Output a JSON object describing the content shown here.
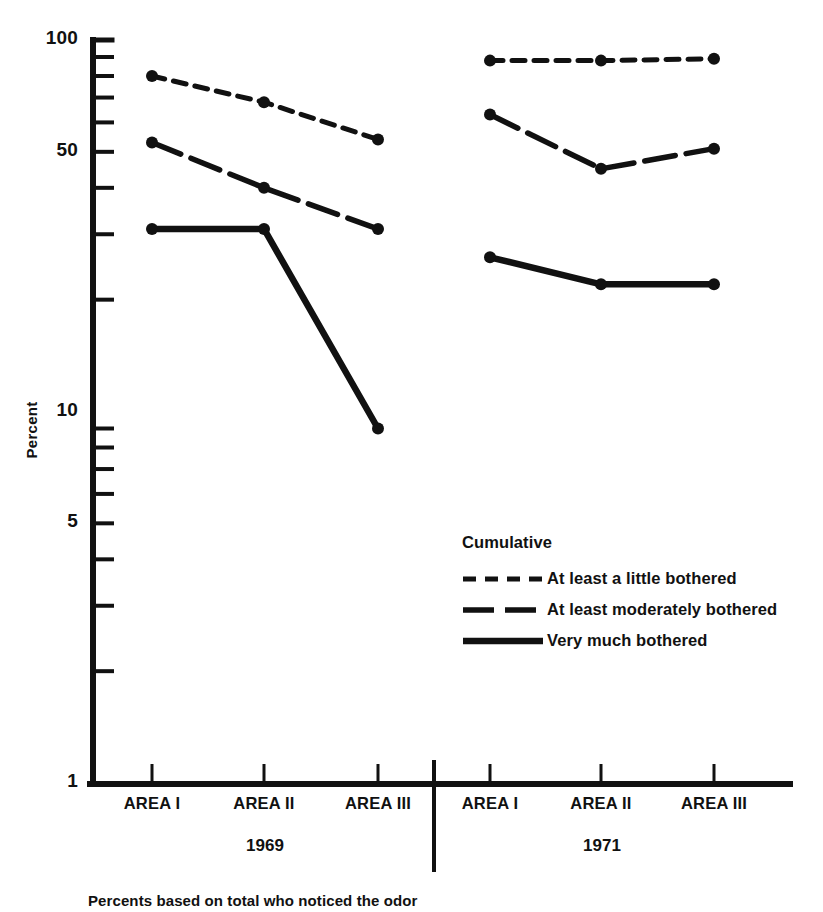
{
  "chart_data": {
    "type": "line",
    "title": "",
    "xlabel": "",
    "ylabel": "Percent",
    "yscale": "log",
    "ylim": [
      1,
      100
    ],
    "ytick_labels": [
      "100",
      "50",
      "10",
      "5",
      "1"
    ],
    "ytick_values": [
      100,
      50,
      10,
      5,
      1
    ],
    "grid": false,
    "legend_position": "inside-lower-right",
    "legend_title": "Cumulative",
    "categories": [
      "AREA I",
      "AREA II",
      "AREA III",
      "AREA I",
      "AREA II",
      "AREA III"
    ],
    "groups": [
      {
        "label": "1969",
        "categories": [
          "AREA I",
          "AREA II",
          "AREA III"
        ]
      },
      {
        "label": "1971",
        "categories": [
          "AREA I",
          "AREA II",
          "AREA III"
        ]
      }
    ],
    "series": [
      {
        "name": "At least a little bothered",
        "style": "short-dash",
        "values_1969": [
          80,
          68,
          54
        ],
        "values_1971": [
          88,
          88,
          89
        ],
        "values": [
          80,
          68,
          54,
          88,
          88,
          89
        ]
      },
      {
        "name": "At least moderately bothered",
        "style": "long-dash",
        "values_1969": [
          53,
          40,
          31
        ],
        "values_1971": [
          63,
          45,
          51
        ],
        "values": [
          53,
          40,
          31,
          63,
          45,
          51
        ]
      },
      {
        "name": "Very much bothered",
        "style": "solid",
        "values_1969": [
          31,
          31,
          9
        ],
        "values_1971": [
          26,
          22,
          22
        ],
        "values": [
          31,
          31,
          9,
          26,
          22,
          22
        ]
      }
    ],
    "annotations": [
      "Percents based on total who noticed the odor"
    ]
  },
  "axes": {
    "y_label": "Percent",
    "y_ticks": [
      {
        "label": "100",
        "value": 100
      },
      {
        "label": "50",
        "value": 50
      },
      {
        "label": "10",
        "value": 10
      },
      {
        "label": "5",
        "value": 5
      },
      {
        "label": "1",
        "value": 1
      }
    ],
    "x_ticks": [
      {
        "label": "AREA I"
      },
      {
        "label": "AREA II"
      },
      {
        "label": "AREA III"
      },
      {
        "label": "AREA I"
      },
      {
        "label": "AREA II"
      },
      {
        "label": "AREA III"
      }
    ],
    "year_groups": [
      {
        "label": "1969"
      },
      {
        "label": "1971"
      }
    ]
  },
  "legend": {
    "title": "Cumulative",
    "items": [
      {
        "label": "At least a little bothered",
        "style": "short-dash"
      },
      {
        "label": "At least moderately bothered",
        "style": "long-dash"
      },
      {
        "label": "Very much bothered",
        "style": "solid"
      }
    ]
  },
  "footnote": "Percents based on total who noticed the odor",
  "colors": {
    "ink": "#111111",
    "background": "#ffffff"
  }
}
